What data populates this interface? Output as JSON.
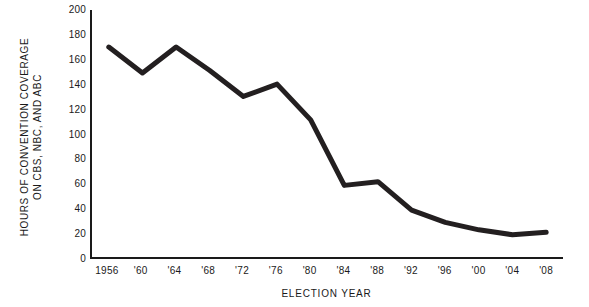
{
  "chart_data": {
    "type": "line",
    "title": "",
    "xlabel": "ELECTION YEAR",
    "ylabel_line1": "HOURS OF CONVENTION COVERAGE",
    "ylabel_line2": "ON CBS, NBC, AND ABC",
    "x_tick_labels": [
      "1956",
      "'60",
      "'64",
      "'68",
      "'72",
      "'76",
      "'80",
      "'84",
      "'88",
      "'92",
      "'96",
      "'00",
      "'04",
      "'08"
    ],
    "y_tick_labels": [
      "0",
      "20",
      "40",
      "60",
      "80",
      "100",
      "120",
      "140",
      "160",
      "180",
      "200"
    ],
    "x": [
      1956,
      1960,
      1964,
      1968,
      1972,
      1976,
      1980,
      1984,
      1988,
      1992,
      1996,
      2000,
      2004,
      2008
    ],
    "values": [
      170,
      149,
      170,
      151,
      130,
      140,
      111,
      58,
      61,
      38,
      28,
      22,
      18,
      20
    ],
    "xlim": [
      1954,
      2010
    ],
    "ylim": [
      0,
      200
    ],
    "grid": false,
    "legend": "none",
    "line_color": "#231f20",
    "axis_color": "#1a1a1a",
    "background": "#ffffff"
  }
}
